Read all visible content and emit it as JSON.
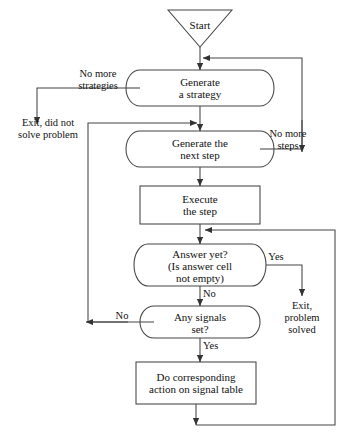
{
  "diagram": {
    "background": "#ffffff",
    "stroke": "#333333",
    "text_color": "#111111",
    "nodes": {
      "start": {
        "label": "Start",
        "shape": "inverted-triangle"
      },
      "generate_strategy": {
        "label": "Generate\na strategy",
        "shape": "capsule"
      },
      "generate_next_step": {
        "label": "Generate the\nnext step",
        "shape": "capsule"
      },
      "execute_step": {
        "label": "Execute\nthe step",
        "shape": "rectangle"
      },
      "answer_yet": {
        "label": "Answer yet?\n(Is answer cell\nnot empty)",
        "shape": "capsule"
      },
      "any_signals": {
        "label": "Any signals\nset?",
        "shape": "capsule"
      },
      "signal_action": {
        "label": "Do corresponding\naction on signal table",
        "shape": "rectangle"
      }
    },
    "edge_labels": {
      "no_more_strategies": "No more\nstrategies",
      "exit_not_solved": "Exit, did not\nsolve problem",
      "no_more_steps": "No more\nsteps",
      "answer_yes": "Yes",
      "answer_no": "No",
      "signals_no": "No",
      "signals_yes": "Yes",
      "exit_solved": "Exit,\nproblem\nsolved"
    }
  }
}
